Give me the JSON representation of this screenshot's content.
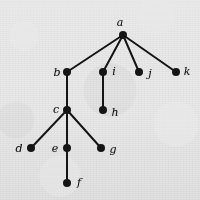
{
  "figure": {
    "kind": "rooted-tree-diagram",
    "width": 200,
    "height": 200,
    "background_color": "#e9e9e9",
    "ink_color": "#151515",
    "node_radius": 4,
    "edge_width": 2
  },
  "graph": {
    "root": "a",
    "nodes": [
      {
        "id": "a",
        "label": "a",
        "x": 123,
        "y": 35,
        "label_x": 120,
        "label_y": 22
      },
      {
        "id": "b",
        "label": "b",
        "x": 67,
        "y": 72,
        "label_x": 57,
        "label_y": 72
      },
      {
        "id": "i",
        "label": "i",
        "x": 103,
        "y": 72,
        "label_x": 114,
        "label_y": 71
      },
      {
        "id": "j",
        "label": "j",
        "x": 139,
        "y": 72,
        "label_x": 150,
        "label_y": 73
      },
      {
        "id": "k",
        "label": "k",
        "x": 176,
        "y": 72,
        "label_x": 187,
        "label_y": 71
      },
      {
        "id": "c",
        "label": "c",
        "x": 67,
        "y": 110,
        "label_x": 56,
        "label_y": 109
      },
      {
        "id": "h",
        "label": "h",
        "x": 103,
        "y": 110,
        "label_x": 115,
        "label_y": 112
      },
      {
        "id": "d",
        "label": "d",
        "x": 31,
        "y": 148,
        "label_x": 19,
        "label_y": 148
      },
      {
        "id": "e",
        "label": "e",
        "x": 67,
        "y": 148,
        "label_x": 55,
        "label_y": 148
      },
      {
        "id": "g",
        "label": "g",
        "x": 101,
        "y": 148,
        "label_x": 113,
        "label_y": 149
      },
      {
        "id": "f",
        "label": "f",
        "x": 67,
        "y": 183,
        "label_x": 79,
        "label_y": 182
      }
    ],
    "edges": [
      {
        "from": "a",
        "to": "b"
      },
      {
        "from": "a",
        "to": "i"
      },
      {
        "from": "a",
        "to": "j"
      },
      {
        "from": "a",
        "to": "k"
      },
      {
        "from": "b",
        "to": "c"
      },
      {
        "from": "i",
        "to": "h"
      },
      {
        "from": "c",
        "to": "d"
      },
      {
        "from": "c",
        "to": "e"
      },
      {
        "from": "c",
        "to": "g"
      },
      {
        "from": "e",
        "to": "f"
      }
    ]
  }
}
